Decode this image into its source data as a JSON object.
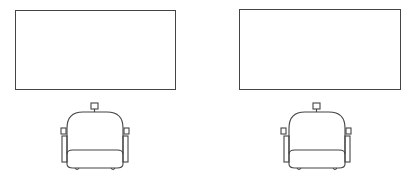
{
  "diagram": {
    "type": "floor-plan",
    "stroke_color": "#444444",
    "background_color": "#ffffff",
    "stations": [
      {
        "id": "station-1",
        "screen": {
          "x": 15,
          "y": 10,
          "width": 161,
          "height": 80
        },
        "chair": {
          "x": 55,
          "y": 98
        }
      },
      {
        "id": "station-2",
        "screen": {
          "x": 239,
          "y": 9,
          "width": 162,
          "height": 81
        },
        "chair": {
          "x": 280,
          "y": 98
        }
      }
    ]
  }
}
